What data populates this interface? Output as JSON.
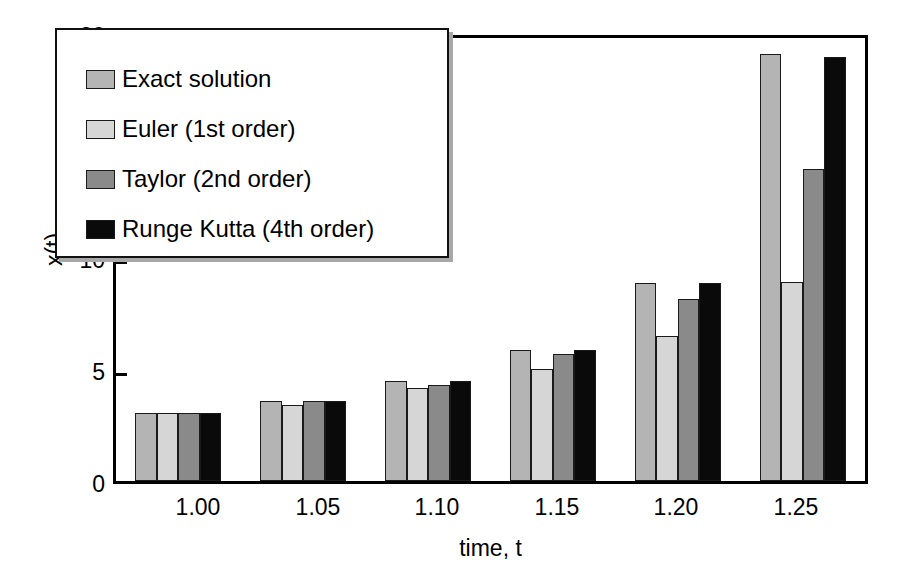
{
  "figure": {
    "background": "#ffffff",
    "frame_color": "#000000"
  },
  "axes": {
    "y_label": "x(t)",
    "y_ticks": [
      "0",
      "5",
      "10",
      "15",
      "20"
    ],
    "x_label": "time, t",
    "x_ticks": [
      "1.00",
      "1.05",
      "1.10",
      "1.15",
      "1.20",
      "1.25"
    ]
  },
  "legend": {
    "position": "upper-left-inside",
    "entries": [
      {
        "label": "Exact solution",
        "color": "#b4b4b4"
      },
      {
        "label": "Euler (1st order)",
        "color": "#d6d6d6"
      },
      {
        "label": "Taylor (2nd order)",
        "color": "#8a8a8a"
      },
      {
        "label": "Runge Kutta (4th order)",
        "color": "#0a0a0a"
      }
    ]
  },
  "chart_data": {
    "type": "bar",
    "title": "",
    "subtitle": "",
    "xlabel": "time, t",
    "ylabel": "x(t)",
    "categories": [
      "1.00",
      "1.05",
      "1.10",
      "1.15",
      "1.20",
      "1.25"
    ],
    "ylim": [
      0,
      20
    ],
    "ytick_values": [
      0,
      5,
      10,
      15,
      20
    ],
    "grid": false,
    "legend_position": "upper left",
    "series": [
      {
        "name": "Exact solution",
        "color": "#b4b4b4",
        "values": [
          3.05,
          3.6,
          4.5,
          5.9,
          8.95,
          19.3
        ]
      },
      {
        "name": "Euler (1st order)",
        "color": "#d6d6d6",
        "values": [
          3.05,
          3.45,
          4.2,
          5.05,
          6.55,
          9.0
        ]
      },
      {
        "name": "Taylor (2nd order)",
        "color": "#8a8a8a",
        "values": [
          3.05,
          3.6,
          4.35,
          5.75,
          8.2,
          14.1
        ]
      },
      {
        "name": "Runge Kutta (4th order)",
        "color": "#0a0a0a",
        "values": [
          3.05,
          3.6,
          4.5,
          5.9,
          8.95,
          19.15
        ]
      }
    ]
  }
}
